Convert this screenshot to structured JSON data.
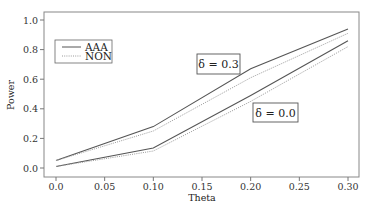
{
  "chart_data": {
    "type": "line",
    "title": "",
    "xlabel": "Theta",
    "ylabel": "Power",
    "xlim": [
      0.0,
      0.3
    ],
    "ylim": [
      0.0,
      1.0
    ],
    "grid": false,
    "legend_position": "upper-left",
    "x": [
      0.0,
      0.1,
      0.2,
      0.3
    ],
    "x_ticks": [
      "0.0",
      "0.05",
      "0.10",
      "0.15",
      "0.20",
      "0.25",
      "0.30"
    ],
    "y_ticks": [
      "0.0",
      "0.2",
      "0.4",
      "0.6",
      "0.8",
      "1.0"
    ],
    "legend": [
      {
        "label": "AAA",
        "style": "solid",
        "color": "#555555"
      },
      {
        "label": "NON",
        "style": "dotted",
        "color": "#999999"
      }
    ],
    "series": [
      {
        "name": "AAA (δ = 0.3)",
        "method": "AAA",
        "delta": 0.3,
        "style": "solid",
        "values": [
          0.05,
          0.28,
          0.67,
          0.94
        ]
      },
      {
        "name": "NON (δ = 0.3)",
        "method": "NON",
        "delta": 0.3,
        "style": "dotted",
        "values": [
          0.05,
          0.25,
          0.61,
          0.91
        ]
      },
      {
        "name": "AAA (δ = 0.0)",
        "method": "AAA",
        "delta": 0.0,
        "style": "solid",
        "values": [
          0.01,
          0.135,
          0.49,
          0.86
        ]
      },
      {
        "name": "NON (δ = 0.0)",
        "method": "NON",
        "delta": 0.0,
        "style": "dotted",
        "values": [
          0.01,
          0.115,
          0.45,
          0.82
        ]
      }
    ],
    "annotations": [
      {
        "text": "δ = 0.3",
        "x": 0.18,
        "y": 0.72,
        "boxed": true
      },
      {
        "text": "δ = 0.0",
        "x": 0.23,
        "y": 0.4,
        "boxed": true
      }
    ]
  }
}
